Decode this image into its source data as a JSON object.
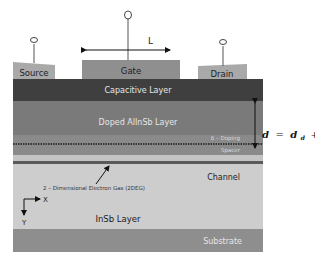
{
  "contacts": {
    "source": "Source",
    "gate": "Gate",
    "drain": "Drain"
  },
  "gate_length_label": "L",
  "layers": {
    "capacitive": "Capacitive Layer",
    "doped": "Doped AlInSb Layer",
    "delta_doping": "δ – Doping",
    "spacer": "Spacer",
    "channel": "Channel",
    "twodeg": "2 – Dimensional Electron Gas (2DEG)",
    "insb": "InSb Layer",
    "substrate": "Substrate"
  },
  "axes": {
    "x": "X",
    "y": "Y"
  },
  "thickness_equation": {
    "lhs": "d",
    "eq": "=",
    "t1": "d",
    "t1_sub": "d",
    "plus": "+",
    "t2": "d",
    "t2_sub": "i"
  },
  "colors": {
    "contact": "#a9a9a9",
    "capacitive": "#3f3f3f",
    "doped": "#7a7a7a",
    "spacer": "#8a8a8a",
    "thin_band": "#c4c4c4",
    "twodeg_line": "#5a5a5a",
    "channel": "#cdcdcd",
    "substrate": "#8e8e8e"
  }
}
